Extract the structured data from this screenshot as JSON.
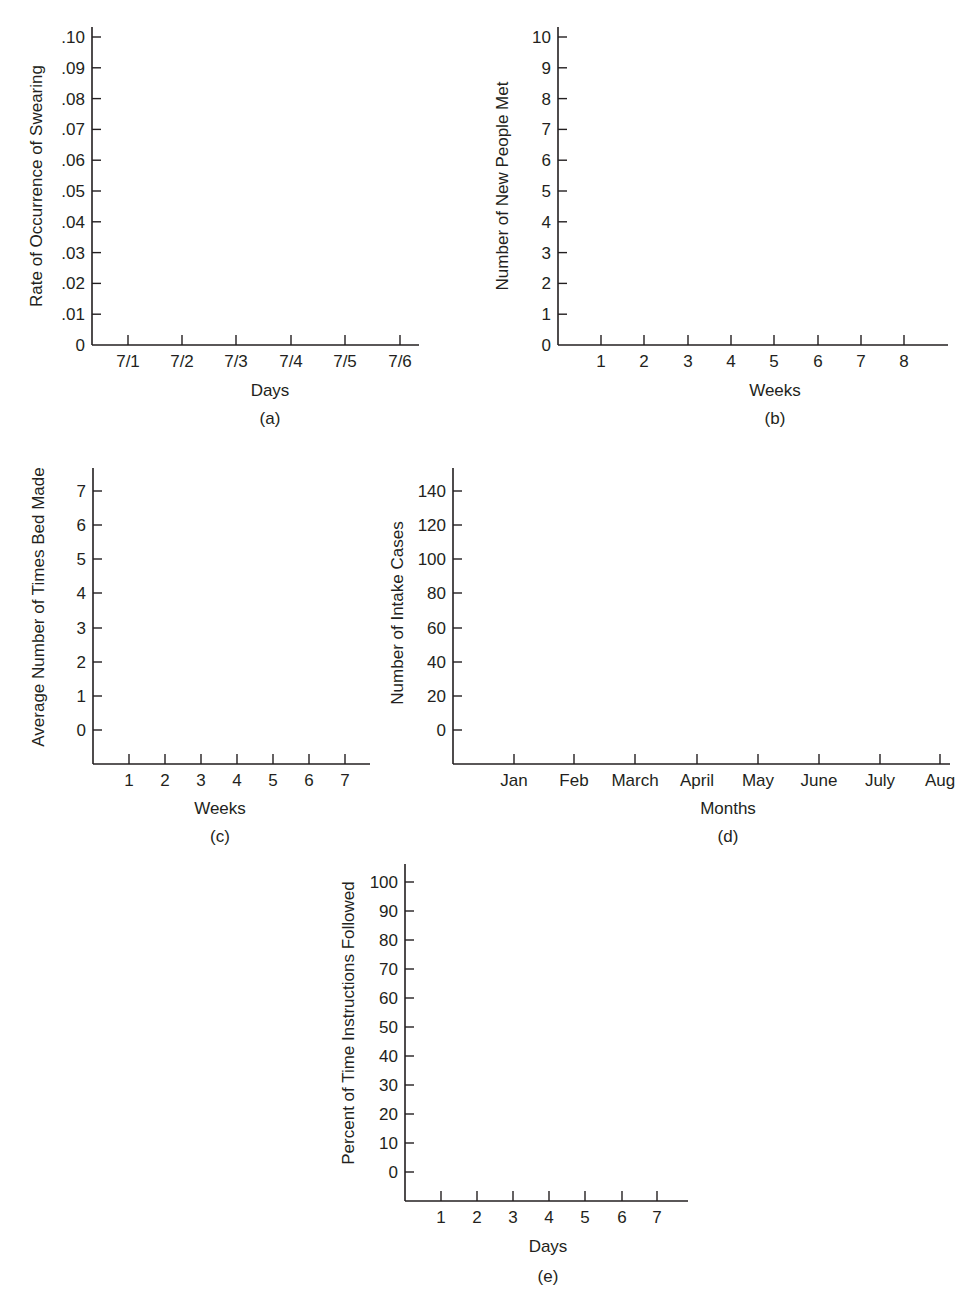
{
  "chart_data": [
    {
      "id": "a",
      "type": "line",
      "panel_label": "(a)",
      "title": "",
      "xlabel": "Days",
      "ylabel": "Rate of Occurrence of Swearing",
      "categories": [
        "7/1",
        "7/2",
        "7/3",
        "7/4",
        "7/5",
        "7/6"
      ],
      "yticks": [
        "0",
        ".01",
        ".02",
        ".03",
        ".04",
        ".05",
        ".06",
        ".07",
        ".08",
        ".09",
        ".10"
      ],
      "ylim": [
        0,
        0.1
      ],
      "series": [],
      "grid": false,
      "geom": {
        "x0": 92,
        "xEnd": 419,
        "yTop": 27,
        "xAxisY": 345,
        "xTicks": [
          128,
          182,
          236,
          291,
          345,
          400
        ],
        "yTickY": [
          345,
          314.2,
          283.4,
          252.6,
          221.8,
          191,
          160.2,
          129.4,
          98.6,
          67.8,
          37
        ],
        "xlabelY": 396,
        "panelY": 424,
        "ylabelX": 42,
        "ylabelCenterY": 186,
        "xlabelX": 270
      }
    },
    {
      "id": "b",
      "type": "line",
      "panel_label": "(b)",
      "title": "",
      "xlabel": "Weeks",
      "ylabel": "Number of New People Met",
      "categories": [
        "1",
        "2",
        "3",
        "4",
        "5",
        "6",
        "7",
        "8"
      ],
      "yticks": [
        "0",
        "1",
        "2",
        "3",
        "4",
        "5",
        "6",
        "7",
        "8",
        "9",
        "10"
      ],
      "ylim": [
        0,
        10
      ],
      "series": [],
      "grid": false,
      "geom": {
        "x0": 558,
        "xEnd": 948,
        "yTop": 27,
        "xAxisY": 345,
        "xTicks": [
          601,
          644,
          688,
          731,
          774,
          818,
          861,
          904
        ],
        "yTickY": [
          345,
          314.2,
          283.4,
          252.6,
          221.8,
          191,
          160.2,
          129.4,
          98.6,
          67.8,
          37
        ],
        "xlabelY": 396,
        "panelY": 424,
        "ylabelX": 508,
        "ylabelCenterY": 186,
        "xlabelX": 775
      }
    },
    {
      "id": "c",
      "type": "line",
      "panel_label": "(c)",
      "title": "",
      "xlabel": "Weeks",
      "ylabel": "Average Number of Times Bed Made",
      "categories": [
        "1",
        "2",
        "3",
        "4",
        "5",
        "6",
        "7"
      ],
      "yticks": [
        "0",
        "1",
        "2",
        "3",
        "4",
        "5",
        "6",
        "7"
      ],
      "ylim": [
        0,
        7
      ],
      "series": [],
      "grid": false,
      "geom": {
        "x0": 93,
        "xEnd": 370,
        "yTop": 468,
        "xAxisY": 764,
        "xTicks": [
          129,
          165,
          201,
          237,
          273,
          309,
          345
        ],
        "yTickY": [
          730,
          696,
          662,
          628,
          593,
          559,
          525,
          491
        ],
        "xlabelY": 814,
        "panelY": 842,
        "ylabelX": 44,
        "ylabelCenterY": 607,
        "xlabelX": 220
      }
    },
    {
      "id": "d",
      "type": "line",
      "panel_label": "(d)",
      "title": "",
      "xlabel": "Months",
      "ylabel": "Number of Intake Cases",
      "categories": [
        "Jan",
        "Feb",
        "March",
        "April",
        "May",
        "June",
        "July",
        "Aug"
      ],
      "yticks": [
        "0",
        "20",
        "40",
        "60",
        "80",
        "100",
        "120",
        "140"
      ],
      "ylim": [
        0,
        140
      ],
      "series": [],
      "grid": false,
      "geom": {
        "x0": 453,
        "xEnd": 950,
        "yTop": 468,
        "xAxisY": 764,
        "xTicks": [
          514,
          574,
          635,
          697,
          758,
          819,
          880,
          940
        ],
        "yTickY": [
          730,
          696,
          662,
          628,
          593,
          559,
          525,
          491
        ],
        "xlabelY": 814,
        "panelY": 842,
        "ylabelX": 403,
        "ylabelCenterY": 613,
        "xlabelX": 728
      }
    },
    {
      "id": "e",
      "type": "line",
      "panel_label": "(e)",
      "title": "",
      "xlabel": "Days",
      "ylabel": "Percent of Time Instructions Followed",
      "categories": [
        "1",
        "2",
        "3",
        "4",
        "5",
        "6",
        "7"
      ],
      "yticks": [
        "0",
        "10",
        "20",
        "30",
        "40",
        "50",
        "60",
        "70",
        "80",
        "90",
        "100"
      ],
      "ylim": [
        0,
        100
      ],
      "series": [],
      "grid": false,
      "geom": {
        "x0": 405,
        "xEnd": 688,
        "yTop": 864,
        "xAxisY": 1201,
        "xTicks": [
          441,
          477,
          513,
          549,
          585,
          622,
          657
        ],
        "yTickY": [
          1172,
          1143,
          1114,
          1085,
          1056,
          1027,
          998,
          969,
          940,
          911,
          882
        ],
        "xlabelY": 1252,
        "panelY": 1282,
        "ylabelX": 354,
        "ylabelCenterY": 1023,
        "xlabelX": 548
      }
    }
  ]
}
